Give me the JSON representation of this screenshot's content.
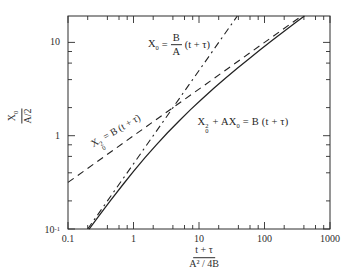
{
  "figure": {
    "background": "#ffffff",
    "ink_color": "#2d2d2d",
    "curve_color": "#222222"
  },
  "chart_data": {
    "type": "line",
    "title": "",
    "grid": false,
    "legend": "none",
    "x_axis": {
      "scale": "log",
      "range": [
        0.1,
        1000
      ],
      "major_ticks": [
        0.1,
        1,
        10,
        100,
        1000
      ],
      "major_tick_labels": [
        "0.1",
        "1",
        "10",
        "100",
        "1000"
      ],
      "minor_ticks": [
        0.2,
        0.4,
        0.6,
        0.8,
        2,
        4,
        6,
        8,
        20,
        40,
        60,
        80,
        200,
        400,
        600,
        800
      ],
      "label": "(t + τ) / (A² / 4B)"
    },
    "y_axis": {
      "scale": "log",
      "range": [
        0.1,
        19.2
      ],
      "major_ticks": [
        0.1,
        1,
        10
      ],
      "major_tick_labels": [
        "10^-1",
        "1",
        "10"
      ],
      "minor_ticks": [
        0.2,
        0.4,
        0.6,
        0.8,
        2,
        4,
        6,
        8
      ],
      "label": "X₀ / (A/2)"
    },
    "series": [
      {
        "name": "linear-asymptote",
        "equation": "X₀ = (B/A)(t + τ)",
        "style": "dash-dot",
        "points": [
          [
            0.2,
            0.1
          ],
          [
            38.4,
            19.2
          ]
        ]
      },
      {
        "name": "parabolic-asymptote",
        "equation": "X₀² = B(t + τ)",
        "style": "dashed",
        "points": [
          [
            0.1,
            0.316
          ],
          [
            368.6,
            19.2
          ]
        ]
      },
      {
        "name": "linear-parabolic-solution",
        "equation": "X₀² + AX₀ = B(t + τ)",
        "style": "solid",
        "points": [
          [
            0.21,
            0.1
          ],
          [
            0.3,
            0.14
          ],
          [
            0.45,
            0.204
          ],
          [
            0.7,
            0.304
          ],
          [
            1,
            0.414
          ],
          [
            1.5,
            0.581
          ],
          [
            2.2,
            0.789
          ],
          [
            3.3,
            1.074
          ],
          [
            5,
            1.449
          ],
          [
            7.5,
            1.915
          ],
          [
            11,
            2.464
          ],
          [
            17,
            3.243
          ],
          [
            25,
            4.099
          ],
          [
            38,
            5.245
          ],
          [
            57,
            6.616
          ],
          [
            86,
            8.327
          ],
          [
            130,
            10.45
          ],
          [
            195,
            13.0
          ],
          [
            292,
            16.12
          ],
          [
            407,
            19.2
          ]
        ]
      }
    ],
    "annotations": [
      {
        "text": "X₀ = (B/A)(t + τ)",
        "x": 4,
        "y": 9.8,
        "rotation": 0
      },
      {
        "text": "X₀² = B(t + τ)",
        "x": 0.54,
        "y": 1.05,
        "rotation": -30
      },
      {
        "text": "X₀² + AX₀ = B(t + τ)",
        "x": 14,
        "y": 1.3,
        "rotation": 0
      }
    ]
  },
  "labels": {
    "eq_linear": {
      "v": "X",
      "v_sub": "0",
      "eq": "=",
      "num": "B",
      "den": "A",
      "tail": "(t + τ)"
    },
    "eq_parabolic": {
      "v": "X",
      "v_sup": "2",
      "v_sub": "0",
      "tail": "= B (t + τ)"
    },
    "eq_mixed": {
      "v": "X",
      "v_sup": "2",
      "v_sub": "0",
      "mid": "+ AX",
      "mid_sub": "0",
      "tail": "= B (t + τ)"
    },
    "y_title": {
      "num": "X",
      "num_sub": "0",
      "den": "A/2"
    },
    "x_title": {
      "num": "t + τ",
      "den": "A² / 4B"
    }
  }
}
